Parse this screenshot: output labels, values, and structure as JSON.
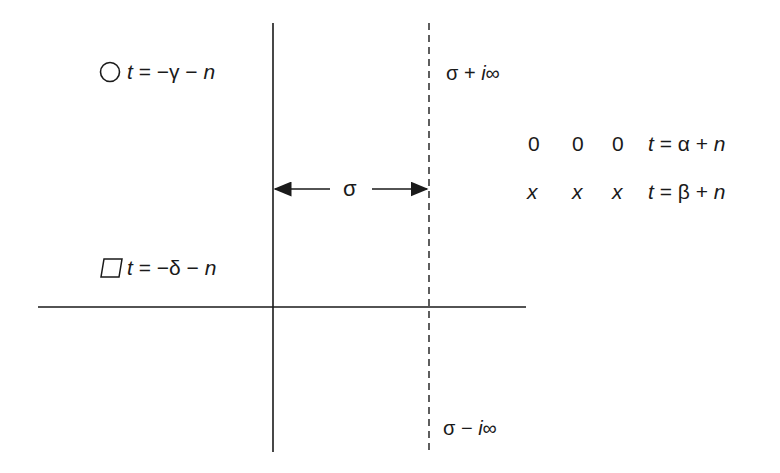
{
  "diagram": {
    "title": "",
    "colors": {
      "ink": "#1a1a1a",
      "background": "#ffffff"
    },
    "axes": {
      "real_axis": {
        "x1": 38,
        "x2": 526,
        "y": 307
      },
      "imag_axis": {
        "x": 273,
        "y1": 23,
        "y2": 452
      },
      "contour": {
        "x": 429,
        "y1": 23,
        "y2": 452,
        "style": "dashed"
      }
    },
    "labels": {
      "left_upper": {
        "marker": "circle-icon",
        "t": "t",
        "eq": " = −γ − ",
        "n": "n"
      },
      "left_lower": {
        "marker": "square-icon",
        "t": "t",
        "eq": " = −δ − ",
        "n": "n"
      },
      "contour_top": {
        "sigma": "σ + ",
        "i": "i",
        "inf": "∞"
      },
      "contour_bottom": {
        "sigma": "σ − ",
        "i": "i",
        "inf": "∞"
      },
      "sigma_width": "σ",
      "right_upper": {
        "markers": [
          "0",
          "0",
          "0"
        ],
        "t": "t",
        "eq": " = α + ",
        "n": "n"
      },
      "right_lower": {
        "markers": [
          "x",
          "x",
          "x"
        ],
        "t": "t",
        "eq": " = β + ",
        "n": "n"
      }
    }
  }
}
